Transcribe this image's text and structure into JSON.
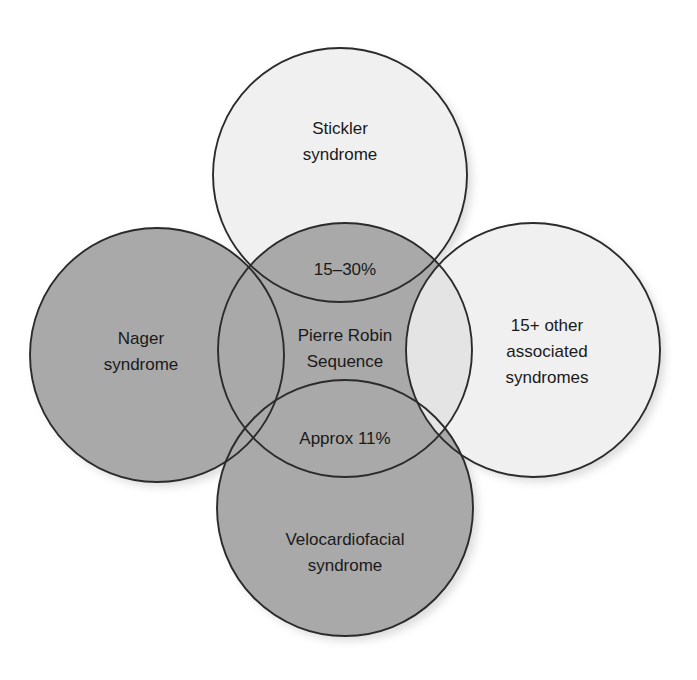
{
  "diagram": {
    "type": "venn-overlap",
    "background_color": "#ffffff",
    "colors": {
      "light_fill": "#f0f0f0",
      "mid_fill": "#a9a9a9",
      "center_fill": "#a9a9a9",
      "stroke": "#2b2b2b",
      "text": "#1a1a1a",
      "shadow": "#c9c9c9"
    },
    "circles": [
      {
        "id": "top",
        "label_lines": [
          "Stickler",
          "syndrome"
        ],
        "fill": "#f0f0f0",
        "cx": 340,
        "cy": 175,
        "r": 127
      },
      {
        "id": "left",
        "label_lines": [
          "Nager",
          "syndrome"
        ],
        "fill": "#a9a9a9",
        "cx": 157,
        "cy": 355,
        "r": 127
      },
      {
        "id": "right",
        "label_lines": [
          "15+ other",
          "associated",
          "syndromes"
        ],
        "fill": "#f0f0f0",
        "cx": 533,
        "cy": 350,
        "r": 127
      },
      {
        "id": "bottom",
        "label_lines": [
          "Velocardiofacial",
          "syndrome"
        ],
        "fill": "#a9a9a9",
        "cx": 345,
        "cy": 508,
        "r": 128
      },
      {
        "id": "center",
        "label_lines": [
          "Pierre Robin",
          "Sequence"
        ],
        "fill": "#a9a9a9",
        "cx": 345,
        "cy": 350,
        "r": 127
      }
    ],
    "overlap_labels": [
      {
        "id": "top-center-overlap",
        "text": "15–30%",
        "x": 345,
        "y": 269
      },
      {
        "id": "bottom-center-overlap",
        "text": "Approx 11%",
        "x": 345,
        "y": 438
      }
    ],
    "labels": {
      "top_line1": "Stickler",
      "top_line2": "syndrome",
      "left_line1": "Nager",
      "left_line2": "syndrome",
      "right_line1": "15+ other",
      "right_line2": "associated",
      "right_line3": "syndromes",
      "bottom_line1": "Velocardiofacial",
      "bottom_line2": "syndrome",
      "center_line1": "Pierre Robin",
      "center_line2": "Sequence",
      "overlap_top": "15–30%",
      "overlap_bottom": "Approx 11%"
    }
  }
}
